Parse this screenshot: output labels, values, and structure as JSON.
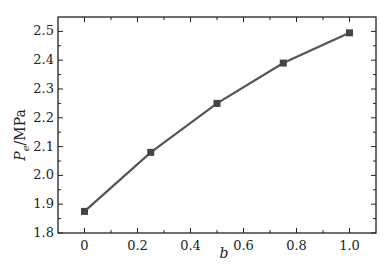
{
  "chart_data": {
    "type": "line",
    "title": "",
    "xlabel": "b",
    "ylabel": "Pe/MPa",
    "ylabel_main": "P",
    "ylabel_sub": "e",
    "ylabel_unit": "/MPa",
    "x": [
      0,
      0.25,
      0.5,
      0.75,
      1.0
    ],
    "series": [
      {
        "name": "Pe",
        "values": [
          1.875,
          2.08,
          2.25,
          2.39,
          2.495
        ],
        "color": "#555555",
        "marker": "square"
      }
    ],
    "xlim": [
      -0.1,
      1.1
    ],
    "ylim": [
      1.8,
      2.55
    ],
    "xticks": [
      "0",
      "0.2",
      "0.4",
      "0.6",
      "0.8",
      "1.0"
    ],
    "yticks": [
      "1.8",
      "1.9",
      "2.0",
      "2.1",
      "2.2",
      "2.3",
      "2.4",
      "2.5"
    ],
    "grid": false,
    "legend": "none"
  }
}
